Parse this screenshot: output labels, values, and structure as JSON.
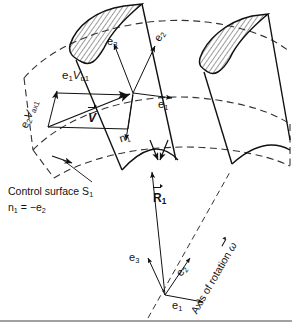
{
  "figure": {
    "colors": {
      "ink": "#111111",
      "background": "#ffffff",
      "dashed": "#333333",
      "hatch": "#222222"
    }
  },
  "labels": {
    "e3_upper": "e3",
    "e3_upper_base": "e",
    "e3_upper_sub": "3",
    "e2_upper_base": "e",
    "e2_upper_sub": "2",
    "e1_center_base": "e",
    "e1_center_sub": "1",
    "n1_base": "n",
    "n1_sub": "1",
    "e2_vax1": "e2Vax1",
    "e2_vax1_parts": {
      "e": "e",
      "e_sub": "2",
      "v": "V",
      "v_sub": "ax1"
    },
    "e1_vu1_parts": {
      "e": "e",
      "e_sub": "1",
      "v": "V",
      "v_sub": "u1"
    },
    "velocity_vector": "V",
    "control_surface": "Control surface S1",
    "control_surface_parts": {
      "text": "Control surface S",
      "sub": "1"
    },
    "normal_relation": "n1 = −e2",
    "normal_relation_parts": {
      "n": "n",
      "n_sub": "1",
      "eq": " = −e",
      "e_sub": "2"
    },
    "R1_base": "R",
    "R1_sub": "1",
    "e3_lower_base": "e",
    "e3_lower_sub": "3",
    "e2_lower_base": "e",
    "e2_lower_sub": "2",
    "e1_lower_base": "e",
    "e1_lower_sub": "1",
    "axis_of_rotation": "Axis of rotation",
    "omega": "ω"
  }
}
